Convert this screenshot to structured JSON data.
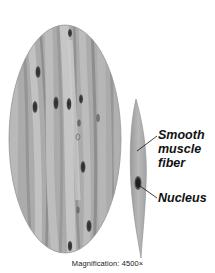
{
  "figure": {
    "colors": {
      "tissue_base": "#a9a9a9",
      "tissue_light": "#c4c4c4",
      "tissue_dark": "#8a8a8a",
      "nucleus": "#3a3a3a",
      "leader_line": "#111111",
      "background": "#ffffff"
    }
  },
  "labels": {
    "fiber_line1": "Smooth",
    "fiber_line2": "muscle",
    "fiber_line3": "fiber",
    "nucleus": "Nucleus"
  },
  "caption": "Magnification: 4500×"
}
